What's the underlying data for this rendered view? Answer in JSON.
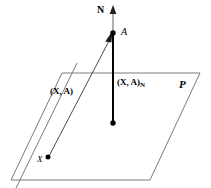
{
  "figure": {
    "background_color": "#ffffff",
    "stroke_color": "#000000",
    "plane_stroke_color": "#595959",
    "width": 211,
    "height": 188
  },
  "labels": {
    "normal_axis": "N",
    "point_a": "A",
    "segment_xa": "(X, A)",
    "segment_xa_projection_base": "(X, A)",
    "segment_xa_projection_sub": "N",
    "plane": "P",
    "point_x": "X"
  },
  "geometry": {
    "plane_corners": [
      {
        "name": "top-left",
        "x": 62,
        "y": 73
      },
      {
        "name": "top-right",
        "x": 200,
        "y": 73
      },
      {
        "name": "bottom-right",
        "x": 150,
        "y": 180
      },
      {
        "name": "bottom-left",
        "x": 11,
        "y": 180
      }
    ],
    "normal_line": {
      "x": 113,
      "y_top": 8,
      "y_bottom": 123
    },
    "point_a": {
      "x": 113,
      "y": 33,
      "radius": 2.6
    },
    "point_foot": {
      "x": 113,
      "y": 123,
      "radius": 2.6
    },
    "point_x": {
      "x": 48,
      "y": 158,
      "radius": 2.4
    },
    "diagonal_line": {
      "x1": 48,
      "y1": 158,
      "x2": 113,
      "y2": 33
    },
    "plane_diagonal_edge": {
      "x1": 16,
      "y1": 188,
      "x2": 75,
      "y2": 72
    }
  }
}
